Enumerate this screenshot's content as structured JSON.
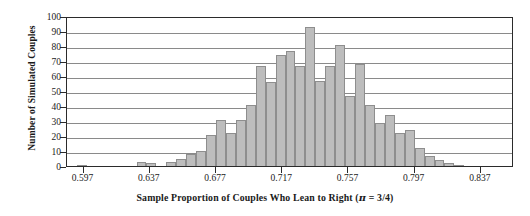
{
  "chart_data": {
    "type": "bar",
    "title": "",
    "xlabel": "Sample Proportion of Couples Who Lean to Right (π = 3/4)",
    "ylabel": "Number of Simulated Couples",
    "ylim": [
      0,
      100
    ],
    "ytick_labels": [
      "100",
      "90",
      "80",
      "70",
      "60",
      "50",
      "40",
      "30",
      "20",
      "10",
      "0"
    ],
    "ytick_values": [
      100,
      90,
      80,
      70,
      60,
      50,
      40,
      30,
      20,
      10,
      0
    ],
    "xtick_labels": [
      "0.597",
      "0.637",
      "0.677",
      "0.717",
      "0.757",
      "0.797",
      "0.837"
    ],
    "xtick_values": [
      0.597,
      0.637,
      0.677,
      0.717,
      0.757,
      0.797,
      0.837
    ],
    "xlim": [
      0.587,
      0.857
    ],
    "bin_width": 0.006,
    "grid": "horizontal",
    "legend": "none",
    "bar_color": "#bdbdbd",
    "bar_edge_color": "#8e8e8e",
    "axis_color": "#2b2b2b",
    "gridline_color": "#8a8a8a",
    "categories": [
      "0.587",
      "0.593",
      "0.599",
      "0.605",
      "0.611",
      "0.617",
      "0.623",
      "0.629",
      "0.635",
      "0.641",
      "0.647",
      "0.653",
      "0.659",
      "0.665",
      "0.671",
      "0.677",
      "0.683",
      "0.689",
      "0.695",
      "0.701",
      "0.707",
      "0.713",
      "0.719",
      "0.725",
      "0.731",
      "0.737",
      "0.743",
      "0.749",
      "0.755",
      "0.761",
      "0.767",
      "0.773",
      "0.779",
      "0.785",
      "0.791",
      "0.797",
      "0.803",
      "0.809",
      "0.815",
      "0.821",
      "0.827",
      "0.833",
      "0.839",
      "0.845",
      "0.851"
    ],
    "values": [
      0,
      1,
      0,
      0,
      0,
      0,
      0,
      3,
      2,
      0,
      3,
      5,
      8,
      10,
      21,
      31,
      22,
      31,
      41,
      67,
      56,
      74,
      77,
      67,
      93,
      57,
      67,
      81,
      47,
      68,
      41,
      29,
      34,
      22,
      24,
      12,
      7,
      4,
      2,
      1,
      0,
      0,
      0,
      0,
      0
    ],
    "peak_value": 93,
    "peak_category": "0.755",
    "note": "Simulated sampling distribution of sample proportion, centered near 0.75"
  },
  "figure": {
    "background": "#ffffff",
    "width": 530,
    "height": 216
  }
}
